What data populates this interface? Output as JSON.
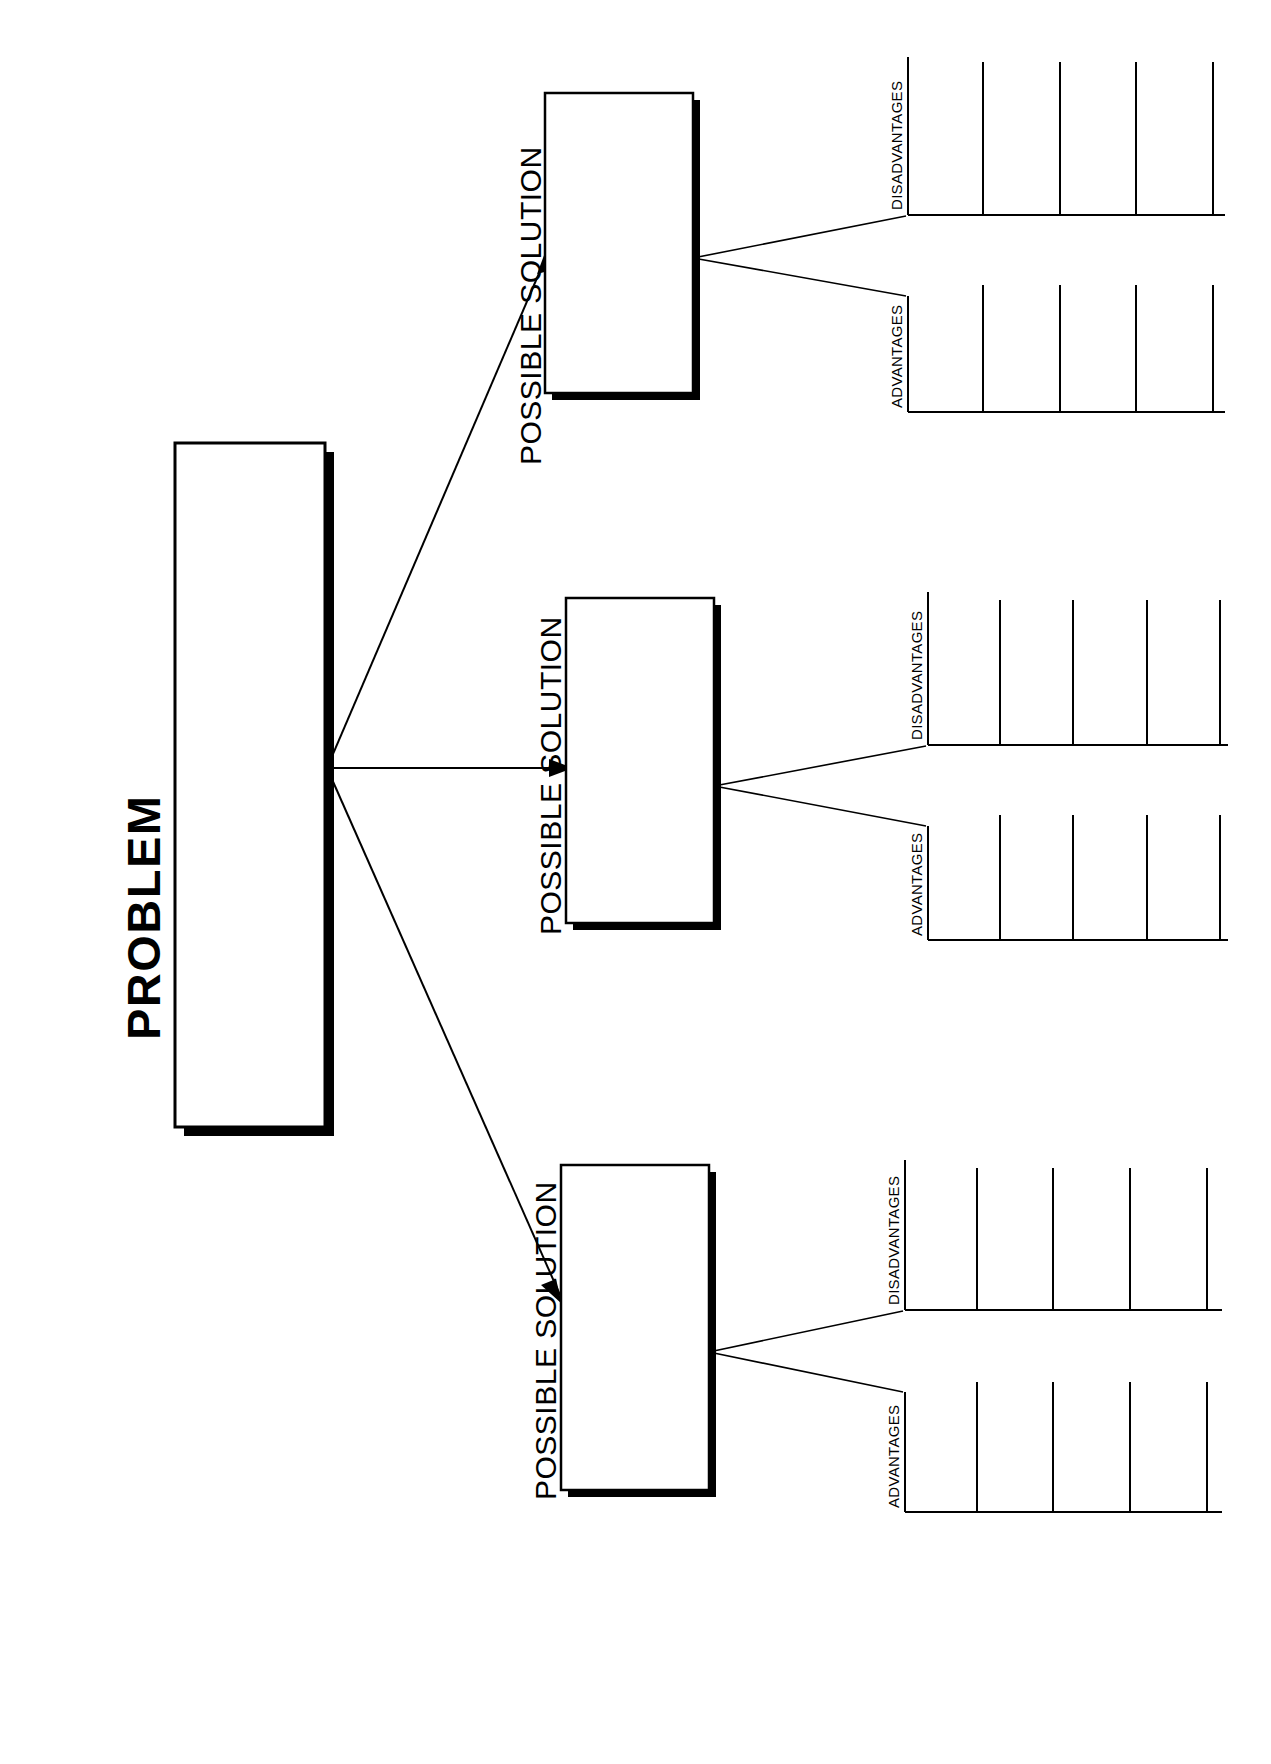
{
  "document": {
    "title": "PROBLEM",
    "orientation": "rotated-90",
    "background_color": "#ffffff",
    "ink_color": "#000000"
  },
  "problem": {
    "label": "PROBLEM"
  },
  "solutions": [
    {
      "label": "POSSIBLE SOLUTION",
      "advantages": {
        "label": "ADVANTAGES",
        "line_count": 4,
        "entries": [
          "",
          "",
          "",
          ""
        ]
      },
      "disadvantages": {
        "label": "DISADVANTAGES",
        "line_count": 4,
        "entries": [
          "",
          "",
          "",
          ""
        ]
      }
    },
    {
      "label": "POSSIBLE SOLUTION",
      "advantages": {
        "label": "ADVANTAGES",
        "line_count": 4,
        "entries": [
          "",
          "",
          "",
          ""
        ]
      },
      "disadvantages": {
        "label": "DISADVANTAGES",
        "line_count": 4,
        "entries": [
          "",
          "",
          "",
          ""
        ]
      }
    },
    {
      "label": "POSSIBLE SOLUTION",
      "advantages": {
        "label": "ADVANTAGES",
        "line_count": 4,
        "entries": [
          "",
          "",
          "",
          ""
        ]
      },
      "disadvantages": {
        "label": "DISADVANTAGES",
        "line_count": 4,
        "entries": [
          "",
          "",
          "",
          ""
        ]
      }
    }
  ],
  "connectors": {
    "count": 3,
    "style": "arrow",
    "description": "three arrows fan out from the PROBLEM box to each POSSIBLE SOLUTION box"
  }
}
